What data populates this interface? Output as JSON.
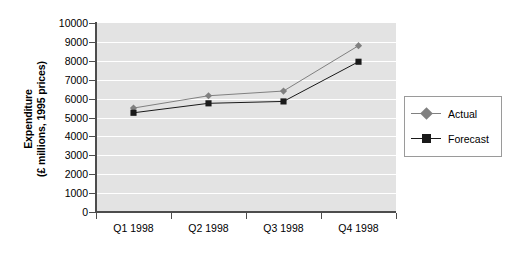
{
  "chart_data": {
    "type": "line",
    "title": "",
    "xlabel": "",
    "ylabel": "Expenditure (£ millions, 1995 prices)",
    "ylabel_line1": "Expenditure",
    "ylabel_line2": "(£ millions, 1995 prices)",
    "categories": [
      "Q1 1998",
      "Q2 1998",
      "Q3 1998",
      "Q4 1998"
    ],
    "series": [
      {
        "name": "Actual",
        "values": [
          5500,
          6150,
          6400,
          8800
        ],
        "color": "#808080",
        "marker": "diamond"
      },
      {
        "name": "Forecast",
        "values": [
          5250,
          5750,
          5850,
          7950
        ],
        "color": "#1a1a1a",
        "marker": "square"
      }
    ],
    "ylim": [
      0,
      10000
    ],
    "ytick_step": 1000,
    "yticks": [
      "10000",
      "9000",
      "8000",
      "7000",
      "6000",
      "5000",
      "4000",
      "3000",
      "2000",
      "1000",
      "0"
    ],
    "grid": true,
    "grid_color": "#ffffff",
    "plot_background": "#e3e3e3",
    "axis_color": "#4d4d4d",
    "legend_position": "right"
  },
  "legend": {
    "entries": [
      {
        "label": "Actual"
      },
      {
        "label": "Forecast"
      }
    ]
  }
}
